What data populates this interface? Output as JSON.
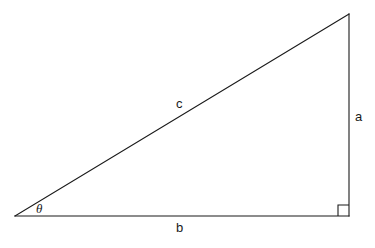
{
  "figure": {
    "type": "right-triangle-diagram",
    "background_color": "#ffffff",
    "stroke_color": "#1a1a1a",
    "width": 375,
    "height": 248
  },
  "labels": {
    "opposite_side": "a",
    "adjacent_side": "b",
    "hypotenuse": "c",
    "angle": "θ"
  },
  "geometry": {
    "vertices": {
      "angle_vertex": [
        15,
        216
      ],
      "right_angle_vertex": [
        349,
        216
      ],
      "top_vertex": [
        349,
        14
      ]
    },
    "edges": [
      {
        "name": "adjacent-b",
        "from": [
          15,
          216
        ],
        "to": [
          349,
          216
        ]
      },
      {
        "name": "opposite-a",
        "from": [
          349,
          216
        ],
        "to": [
          349,
          14
        ]
      },
      {
        "name": "hypotenuse-c",
        "from": [
          15,
          216
        ],
        "to": [
          349,
          14
        ]
      }
    ],
    "right_angle_marker": {
      "x": 338,
      "y": 205,
      "size": 11
    }
  }
}
